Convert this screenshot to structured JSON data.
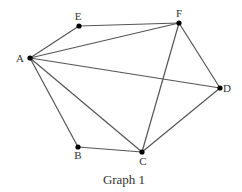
{
  "figure": {
    "caption": "Graph 1",
    "caption_pos": {
      "x": 124,
      "y": 184
    },
    "edge_color": "#555555",
    "vertex_color": "#000000",
    "label_color": "#333333"
  },
  "vertices": [
    {
      "id": "A",
      "label": "A",
      "x": 30,
      "y": 58,
      "lx": 20,
      "ly": 62
    },
    {
      "id": "E",
      "label": "E",
      "x": 79,
      "y": 26,
      "lx": 78,
      "ly": 20
    },
    {
      "id": "F",
      "label": "F",
      "x": 179,
      "y": 23,
      "lx": 179,
      "ly": 17
    },
    {
      "id": "D",
      "label": "D",
      "x": 220,
      "y": 88,
      "lx": 227,
      "ly": 92
    },
    {
      "id": "C",
      "label": "C",
      "x": 142,
      "y": 152,
      "lx": 143,
      "ly": 165
    },
    {
      "id": "B",
      "label": "B",
      "x": 78,
      "y": 147,
      "lx": 78,
      "ly": 159
    }
  ],
  "edges": [
    [
      "A",
      "E"
    ],
    [
      "E",
      "F"
    ],
    [
      "A",
      "F"
    ],
    [
      "A",
      "D"
    ],
    [
      "A",
      "B"
    ],
    [
      "A",
      "C"
    ],
    [
      "F",
      "D"
    ],
    [
      "F",
      "C"
    ],
    [
      "D",
      "C"
    ],
    [
      "B",
      "C"
    ]
  ]
}
